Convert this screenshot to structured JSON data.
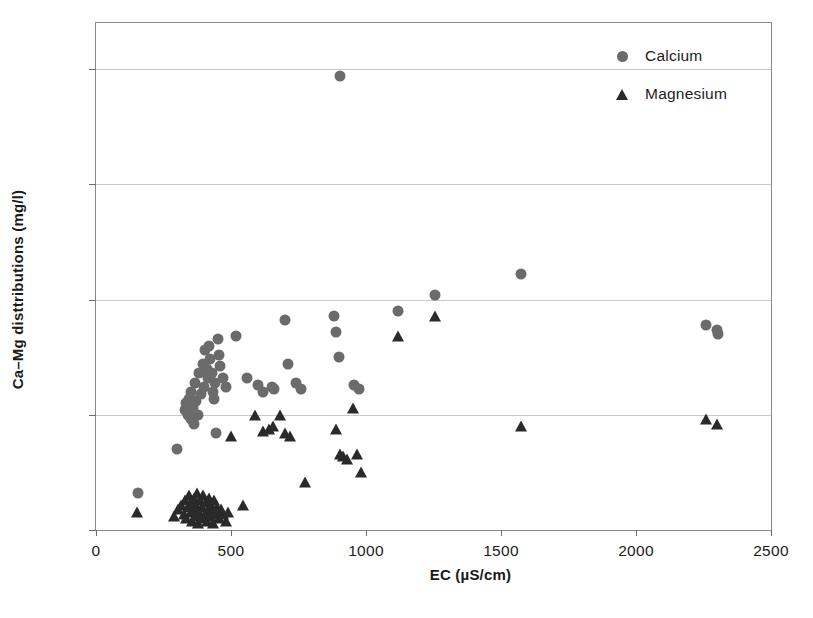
{
  "chart_data": {
    "type": "scatter",
    "title": "",
    "xlabel": "EC (µS/cm)",
    "ylabel": "Ca–Mg disttributions (mg/l)",
    "xlim": [
      0,
      2500
    ],
    "ylim": [
      0,
      220
    ],
    "xticks": [
      0,
      500,
      1000,
      1500,
      2000,
      2500
    ],
    "yticks": [
      0,
      50,
      100,
      150,
      200
    ],
    "xtick_labels": [
      "0",
      "500",
      "1000",
      "1500",
      "2000",
      "2500"
    ],
    "ytick_labels": [
      "0",
      "50",
      "100",
      "150",
      "200"
    ],
    "grid": "horizontal",
    "legend_position": "top-right-inside",
    "series": [
      {
        "name": "Calcium",
        "marker": "circle",
        "color": "#6b6b6b",
        "points": [
          [
            155,
            16
          ],
          [
            300,
            35
          ],
          [
            330,
            52
          ],
          [
            335,
            55
          ],
          [
            340,
            50
          ],
          [
            345,
            57
          ],
          [
            350,
            48
          ],
          [
            352,
            60
          ],
          [
            358,
            53
          ],
          [
            362,
            46
          ],
          [
            368,
            64
          ],
          [
            372,
            56
          ],
          [
            378,
            50
          ],
          [
            382,
            68
          ],
          [
            390,
            59
          ],
          [
            395,
            72
          ],
          [
            400,
            62
          ],
          [
            405,
            78
          ],
          [
            410,
            70
          ],
          [
            415,
            66
          ],
          [
            418,
            80
          ],
          [
            422,
            74
          ],
          [
            428,
            68
          ],
          [
            432,
            60
          ],
          [
            436,
            57
          ],
          [
            440,
            64
          ],
          [
            445,
            42
          ],
          [
            450,
            83
          ],
          [
            455,
            76
          ],
          [
            460,
            71
          ],
          [
            470,
            66
          ],
          [
            480,
            62
          ],
          [
            520,
            84
          ],
          [
            560,
            66
          ],
          [
            600,
            63
          ],
          [
            620,
            60
          ],
          [
            650,
            62
          ],
          [
            660,
            61
          ],
          [
            700,
            91
          ],
          [
            710,
            72
          ],
          [
            740,
            64
          ],
          [
            760,
            61
          ],
          [
            880,
            93
          ],
          [
            890,
            86
          ],
          [
            900,
            75
          ],
          [
            905,
            197
          ],
          [
            955,
            63
          ],
          [
            975,
            61
          ],
          [
            1120,
            95
          ],
          [
            1255,
            102
          ],
          [
            1575,
            111
          ],
          [
            2260,
            89
          ],
          [
            2300,
            87
          ],
          [
            2305,
            85
          ]
        ]
      },
      {
        "name": "Magnesium",
        "marker": "triangle",
        "color": "#2a2a2a",
        "points": [
          [
            150,
            8
          ],
          [
            290,
            6
          ],
          [
            305,
            9
          ],
          [
            315,
            11
          ],
          [
            325,
            7
          ],
          [
            330,
            13
          ],
          [
            335,
            5
          ],
          [
            340,
            10
          ],
          [
            345,
            15
          ],
          [
            350,
            8
          ],
          [
            352,
            12
          ],
          [
            356,
            4
          ],
          [
            360,
            9
          ],
          [
            364,
            14
          ],
          [
            368,
            6
          ],
          [
            372,
            11
          ],
          [
            375,
            16
          ],
          [
            378,
            3
          ],
          [
            382,
            8
          ],
          [
            386,
            13
          ],
          [
            390,
            5
          ],
          [
            394,
            10
          ],
          [
            398,
            15
          ],
          [
            402,
            7
          ],
          [
            406,
            12
          ],
          [
            410,
            4
          ],
          [
            414,
            9
          ],
          [
            418,
            14
          ],
          [
            422,
            6
          ],
          [
            426,
            11
          ],
          [
            430,
            8
          ],
          [
            434,
            3
          ],
          [
            438,
            13
          ],
          [
            442,
            7
          ],
          [
            448,
            10
          ],
          [
            455,
            5
          ],
          [
            462,
            9
          ],
          [
            470,
            7
          ],
          [
            480,
            4
          ],
          [
            490,
            8
          ],
          [
            500,
            41
          ],
          [
            545,
            11
          ],
          [
            590,
            50
          ],
          [
            620,
            43
          ],
          [
            640,
            44
          ],
          [
            655,
            45
          ],
          [
            680,
            50
          ],
          [
            700,
            42
          ],
          [
            720,
            41
          ],
          [
            775,
            21
          ],
          [
            890,
            44
          ],
          [
            905,
            33
          ],
          [
            915,
            32
          ],
          [
            930,
            31
          ],
          [
            950,
            53
          ],
          [
            965,
            33
          ],
          [
            980,
            25
          ],
          [
            1120,
            84
          ],
          [
            1255,
            93
          ],
          [
            1575,
            45
          ],
          [
            2260,
            48
          ],
          [
            2300,
            46
          ]
        ]
      }
    ]
  },
  "legend": {
    "items": [
      {
        "label": "Calcium",
        "marker": "circle",
        "color": "#6b6b6b"
      },
      {
        "label": "Magnesium",
        "marker": "triangle",
        "color": "#2a2a2a"
      }
    ]
  },
  "axes": {
    "x_title": "EC (µS/cm)",
    "y_title": "Ca–Mg disttributions (mg/l)"
  },
  "caption": {
    "text": ""
  }
}
